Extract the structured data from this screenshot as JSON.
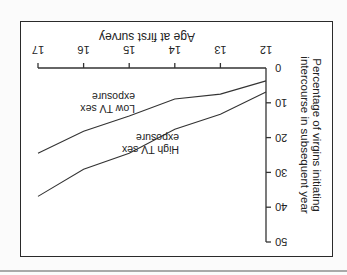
{
  "chart_data": {
    "type": "line",
    "orientation_note": "figure displayed rotated 180 degrees",
    "title": "",
    "xlabel": "Age at first survey",
    "ylabel": "Percentage of virgins initiating intercourse in subsequent year",
    "x": [
      12,
      13,
      14,
      15,
      16,
      17
    ],
    "x_ticks": [
      "12",
      "13",
      "14",
      "15",
      "16",
      "17"
    ],
    "y_ticks": [
      "0",
      "10",
      "20",
      "30",
      "40",
      "50"
    ],
    "ylim": [
      0,
      50
    ],
    "xlim": [
      12,
      17
    ],
    "grid": false,
    "legend": "inline labels",
    "series": [
      {
        "name": "Low TV sex exposure",
        "label_line1": "Low TV sex",
        "label_line2": "exposure",
        "values": [
          3.7,
          7.5,
          8.9,
          13.8,
          18.2,
          24.5
        ]
      },
      {
        "name": "High TV sex exposure",
        "label_line1": "High TV sex",
        "label_line2": "exposure",
        "values": [
          6.9,
          13.3,
          17.6,
          24.5,
          29.1,
          36.9
        ]
      }
    ]
  },
  "colors": {
    "line": "#333333",
    "frame": "#2a2a2a",
    "text": "#222222"
  }
}
